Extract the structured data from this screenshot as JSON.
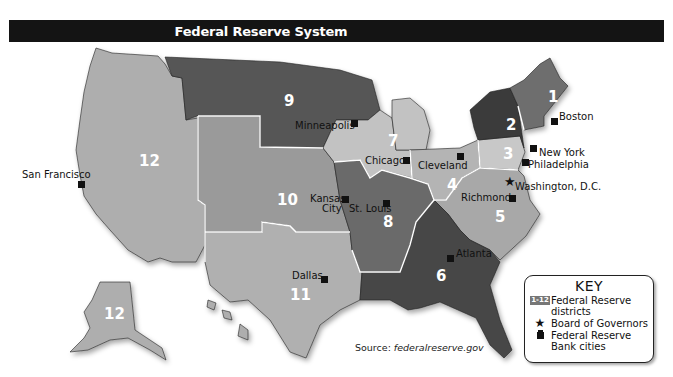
{
  "title": "Federal Reserve System",
  "districts": [
    {
      "number": "1",
      "bank_city": "Boston",
      "color": "#6e6e6e"
    },
    {
      "number": "2",
      "bank_city": "New York",
      "color": "#3a3a3a"
    },
    {
      "number": "3",
      "bank_city": "Philadelphia",
      "color": "#c8c8c8"
    },
    {
      "number": "4",
      "bank_city": "Cleveland",
      "color": "#b4b4b4"
    },
    {
      "number": "5",
      "bank_city": "Richmond",
      "color": "#a8a8a8"
    },
    {
      "number": "6",
      "bank_city": "Atlanta",
      "color": "#464646"
    },
    {
      "number": "7",
      "bank_city": "Chicago",
      "color": "#c2c2c2"
    },
    {
      "number": "8",
      "bank_city": "St. Louis",
      "color": "#6a6a6a"
    },
    {
      "number": "9",
      "bank_city": "Minneapolis",
      "color": "#565656"
    },
    {
      "number": "10",
      "bank_city": "Kansas City",
      "color": "#9a9a9a"
    },
    {
      "number": "11",
      "bank_city": "Dallas",
      "color": "#b0b0b0"
    },
    {
      "number": "12",
      "bank_city": "San Francisco",
      "color": "#aeaeae"
    }
  ],
  "labels": {
    "d1": "1",
    "d2": "2",
    "d3": "3",
    "d4": "4",
    "d5": "5",
    "d6": "6",
    "d7": "7",
    "d8": "8",
    "d9": "9",
    "d10": "10",
    "d11": "11",
    "d12": "12",
    "d12_alaska": "12",
    "boston": "Boston",
    "new_york": "New York",
    "philadelphia": "Philadelphia",
    "washington": "Washington, D.C.",
    "richmond": "Richmond",
    "cleveland": "Cleveland",
    "chicago": "Chicago",
    "minneapolis": "Minneapolis",
    "kansas_city_1": "Kansas",
    "kansas_city_2": "City",
    "st_louis": "St. Louis",
    "atlanta": "Atlanta",
    "dallas": "Dallas",
    "san_francisco": "San Francisco"
  },
  "source": {
    "prefix": "Source: ",
    "site": "federalreserve.gov"
  },
  "key": {
    "title": "KEY",
    "items": [
      {
        "symbol": "1-12",
        "label_1": "Federal Reserve",
        "label_2": "districts"
      },
      {
        "symbol": "★",
        "label_1": "Board of Governors"
      },
      {
        "symbol": "bank-building",
        "label_1": "Federal Reserve",
        "label_2": "Bank cities"
      }
    ]
  }
}
